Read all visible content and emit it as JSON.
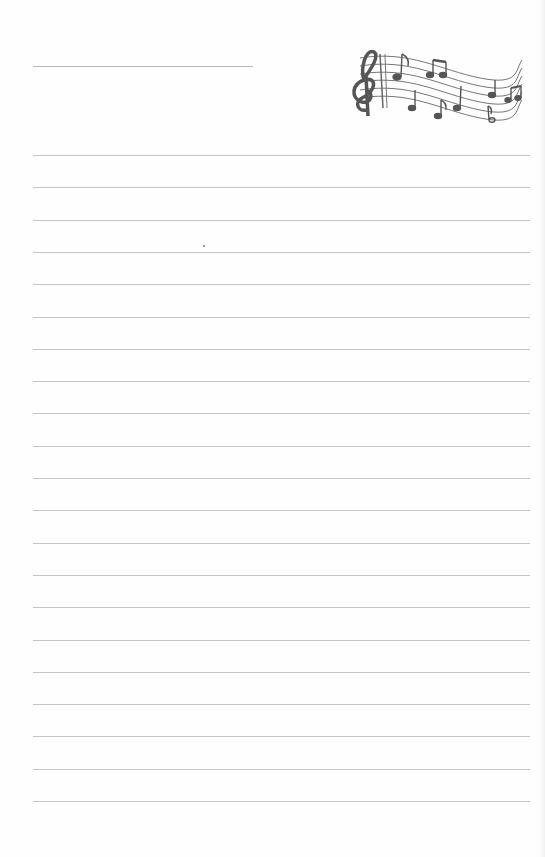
{
  "page": {
    "type": "lined notepaper",
    "title_line": {
      "x": 33,
      "y": 66,
      "width": 220
    },
    "rules": {
      "count": 21,
      "start_y": 155,
      "spacing": 32.3,
      "x": 33,
      "width": 497,
      "color": "#c4c4c4"
    },
    "decoration": {
      "icon": "music-staff-with-treble-clef-and-notes-icon",
      "color": "#555555"
    }
  }
}
